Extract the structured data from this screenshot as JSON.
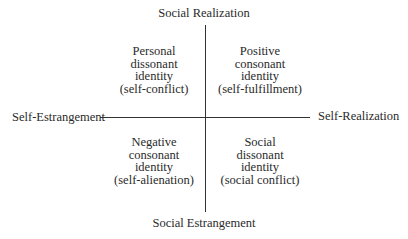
{
  "axes": {
    "top": "Social Realization",
    "bottom": "Social Estrangement",
    "left": "Self-Estrangement",
    "right": "Self-Realization"
  },
  "quadrants": {
    "top_left": [
      "Personal",
      "dissonant",
      "identity",
      "(self-conflict)"
    ],
    "top_right": [
      "Positive",
      "consonant",
      "identity",
      "(self-fulfillment)"
    ],
    "bottom_left": [
      "Negative",
      "consonant",
      "identity",
      "(self-alienation)"
    ],
    "bottom_right": [
      "Social",
      "dissonant",
      "identity",
      "(social conflict)"
    ]
  }
}
